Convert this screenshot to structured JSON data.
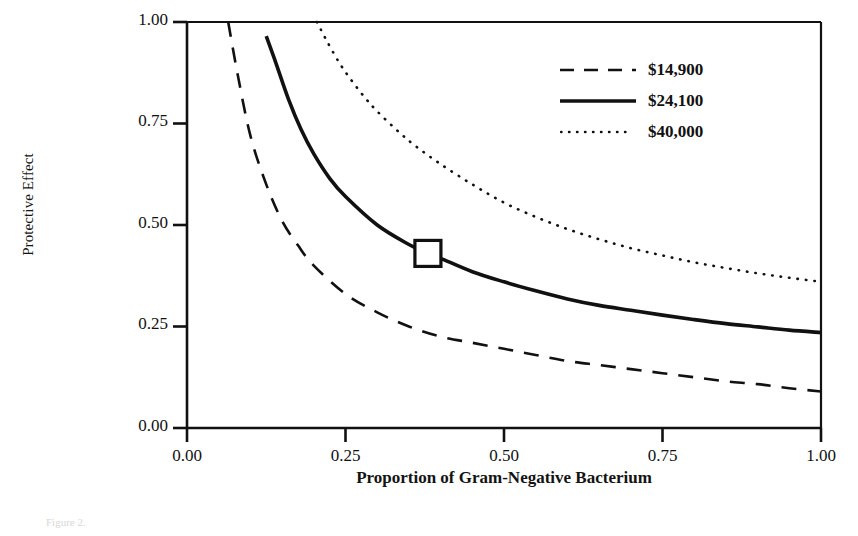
{
  "chart_data": {
    "type": "line",
    "title": "",
    "xlabel": "Proportion of Gram-Negative Bacterium",
    "ylabel": "Protective Effect",
    "xlim": [
      0.0,
      1.0
    ],
    "ylim": [
      0.0,
      1.0
    ],
    "xticks": [
      "0.00",
      "0.25",
      "0.50",
      "0.75",
      "1.00"
    ],
    "xtick_values": [
      0.0,
      0.25,
      0.5,
      0.75,
      1.0
    ],
    "yticks": [
      "0.00",
      "0.25",
      "0.50",
      "0.75",
      "1.00"
    ],
    "ytick_values": [
      0.0,
      0.25,
      0.5,
      0.75,
      1.0
    ],
    "grid": false,
    "legend_position": "top-right",
    "series": [
      {
        "name": "$14,900",
        "style": "dashed",
        "color": "#111111",
        "x": [
          0.065,
          0.08,
          0.1,
          0.125,
          0.15,
          0.175,
          0.2,
          0.25,
          0.3,
          0.35,
          0.4,
          0.45,
          0.5,
          0.55,
          0.6,
          0.65,
          0.7,
          0.75,
          0.8,
          0.85,
          0.9,
          0.95,
          1.0
        ],
        "y": [
          1.0,
          0.87,
          0.72,
          0.6,
          0.51,
          0.45,
          0.4,
          0.33,
          0.285,
          0.25,
          0.225,
          0.21,
          0.195,
          0.18,
          0.165,
          0.155,
          0.145,
          0.135,
          0.125,
          0.115,
          0.108,
          0.098,
          0.09
        ]
      },
      {
        "name": "$24,100",
        "style": "solid",
        "color": "#111111",
        "x": [
          0.125,
          0.14,
          0.16,
          0.18,
          0.2,
          0.225,
          0.25,
          0.3,
          0.35,
          0.38,
          0.4,
          0.45,
          0.5,
          0.55,
          0.6,
          0.65,
          0.7,
          0.75,
          0.8,
          0.85,
          0.9,
          0.95,
          1.0
        ],
        "y": [
          0.965,
          0.9,
          0.81,
          0.735,
          0.675,
          0.615,
          0.57,
          0.5,
          0.452,
          0.43,
          0.418,
          0.385,
          0.36,
          0.338,
          0.318,
          0.302,
          0.29,
          0.278,
          0.267,
          0.257,
          0.249,
          0.241,
          0.235
        ]
      },
      {
        "name": "$40,000",
        "style": "dotted",
        "color": "#111111",
        "x": [
          0.205,
          0.22,
          0.24,
          0.26,
          0.28,
          0.3,
          0.33,
          0.36,
          0.4,
          0.45,
          0.5,
          0.55,
          0.6,
          0.65,
          0.7,
          0.75,
          0.8,
          0.85,
          0.9,
          0.95,
          1.0
        ],
        "y": [
          1.0,
          0.955,
          0.9,
          0.855,
          0.815,
          0.78,
          0.735,
          0.695,
          0.65,
          0.6,
          0.555,
          0.52,
          0.49,
          0.465,
          0.443,
          0.425,
          0.408,
          0.394,
          0.381,
          0.37,
          0.36
        ]
      }
    ],
    "markers": [
      {
        "name": "baseline-point",
        "shape": "open-square",
        "x": 0.38,
        "y": 0.43,
        "series": "$24,100"
      }
    ]
  },
  "axis": {
    "ylabel": "Protective Effect",
    "xlabel": "Proportion of Gram-Negative Bacterium",
    "yticks": [
      "1.00",
      "0.75",
      "0.50",
      "0.25",
      "0.00"
    ],
    "xticks": [
      "0.00",
      "0.25",
      "0.50",
      "0.75",
      "1.00"
    ]
  },
  "legend": {
    "entries": [
      {
        "label": "$14,900",
        "style": "dashed"
      },
      {
        "label": "$24,100",
        "style": "solid"
      },
      {
        "label": "$40,000",
        "style": "dotted"
      }
    ]
  },
  "caption": {
    "text": "Figure 2."
  }
}
